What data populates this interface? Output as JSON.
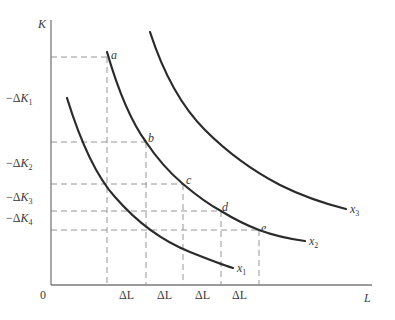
{
  "diagram": {
    "type": "isoquant-map",
    "axes": {
      "y_label": "K",
      "x_label": "L",
      "origin_label": "0"
    },
    "y_tick_labels": [
      {
        "prefix": "−Δ",
        "var": "K",
        "sub": "1"
      },
      {
        "prefix": "−Δ",
        "var": "K",
        "sub": "2"
      },
      {
        "prefix": "−Δ",
        "var": "K",
        "sub": "3"
      },
      {
        "prefix": "−Δ",
        "var": "K",
        "sub": "4"
      }
    ],
    "x_tick_labels": [
      "ΔL",
      "ΔL",
      "ΔL",
      "ΔL"
    ],
    "points": [
      {
        "label": "a",
        "on_curve": "x2"
      },
      {
        "label": "b",
        "on_curve": "x2"
      },
      {
        "label": "c",
        "on_curve": "x2"
      },
      {
        "label": "d",
        "on_curve": "x2"
      },
      {
        "label": "e",
        "on_curve": "x2"
      }
    ],
    "curves": [
      {
        "name": "x",
        "sub": "1"
      },
      {
        "name": "x",
        "sub": "2"
      },
      {
        "name": "x",
        "sub": "3"
      }
    ],
    "colors": {
      "curve": "#2b2b2b",
      "axis": "#7a7a7a",
      "dashed": "#8a8a8a",
      "text": "#3a3a3a"
    }
  }
}
